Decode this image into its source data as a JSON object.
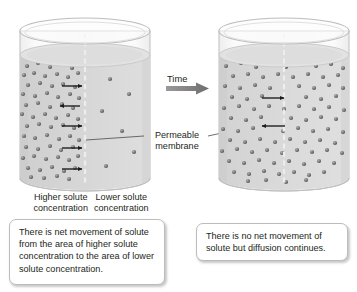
{
  "figure": {
    "title_alt": "Diffusion of solute across a permeable membrane over time",
    "background": "#ffffff"
  },
  "colors": {
    "liquid_fill": "#d5d5d5",
    "liquid_fill_light": "#dcdcdc",
    "glass_stroke": "#b9b9b9",
    "glass_fill": "#f4f4f4",
    "solute_dot": "#6f6f6f",
    "solute_dot_highlight": "#a8a8a8",
    "arrow": "#1a1a1a",
    "time_arrow": "#8c8c8c",
    "caption_border": "#bcbcbc",
    "text": "#231f20",
    "membrane_line": "#e8e8e8"
  },
  "time_arrow": {
    "label": "Time",
    "direction": "right"
  },
  "membrane": {
    "label_line1": "Permeable",
    "label_line2": "membrane",
    "leader_left": true,
    "leader_right": true
  },
  "beaker_left": {
    "name": "initial-state-beaker",
    "labels": {
      "left_line1": "Higher solute",
      "left_line2": "concentration",
      "right_line1": "Lower solute",
      "right_line2": "concentration"
    },
    "net_movement": "right",
    "arrows": [
      {
        "y": 86,
        "direction": "right"
      },
      {
        "y": 106,
        "direction": "left"
      },
      {
        "y": 126,
        "direction": "right"
      },
      {
        "y": 148,
        "direction": "right"
      },
      {
        "y": 169,
        "direction": "right"
      }
    ],
    "solute_left_count": 62,
    "solute_right_count": 6
  },
  "beaker_right": {
    "name": "equilibrium-state-beaker",
    "net_movement": "none",
    "arrows": [
      {
        "y": 98,
        "direction": "right"
      },
      {
        "y": 126,
        "direction": "left"
      }
    ],
    "solute_left_count": 44,
    "solute_right_count": 44
  },
  "captions": {
    "left": "There is net movement of solute from the area of higher solute concentration to the area of lower solute concentration.",
    "right": "There is no net movement of solute but diffusion continues."
  }
}
